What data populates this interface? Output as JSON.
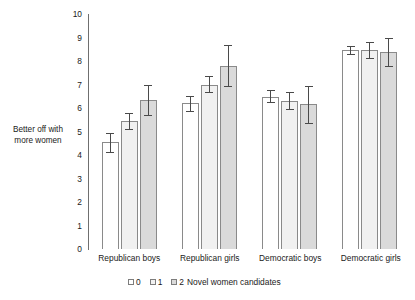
{
  "chart_data": {
    "type": "bar",
    "title": "",
    "xlabel": "",
    "ylabel": "Better off with more women",
    "ylim": [
      0,
      10
    ],
    "yticks": [
      10,
      9,
      8,
      7,
      6,
      5,
      4,
      3,
      2,
      1,
      0
    ],
    "grid": false,
    "legend_position": "bottom",
    "legend_title": "Novel women candidates",
    "categories": [
      "Republican boys",
      "Republican girls",
      "Democratic boys",
      "Democratic girls"
    ],
    "series": [
      {
        "name": "0",
        "fill": "#ffffff",
        "values": [
          4.55,
          6.2,
          6.45,
          8.45
        ],
        "err_low": [
          4.1,
          5.85,
          6.2,
          8.25
        ],
        "err_high": [
          4.95,
          6.5,
          6.75,
          8.65
        ]
      },
      {
        "name": "1",
        "fill": "#f1f1f1",
        "values": [
          5.45,
          7.0,
          6.3,
          8.45
        ],
        "err_low": [
          5.05,
          6.65,
          5.9,
          8.1
        ],
        "err_high": [
          5.8,
          7.35,
          6.7,
          8.8
        ]
      },
      {
        "name": "2",
        "fill": "#dadada",
        "values": [
          6.35,
          7.8,
          6.15,
          8.4
        ],
        "err_low": [
          5.65,
          6.9,
          5.3,
          7.75
        ],
        "err_high": [
          7.0,
          8.7,
          6.95,
          9.0
        ]
      }
    ]
  },
  "legend": {
    "items": [
      {
        "label": "0"
      },
      {
        "label": "1"
      },
      {
        "label": "2"
      }
    ],
    "tail_label": "Novel women candidates"
  },
  "axis": {
    "y_label_line1": "Better off with",
    "y_label_line2": "more women"
  },
  "colors": {
    "axis": "#6f6f6f",
    "bar_border": "#8a8a8a",
    "error_bar": "#4a4a4a",
    "text": "#1a1a1a",
    "background": "#ffffff"
  }
}
